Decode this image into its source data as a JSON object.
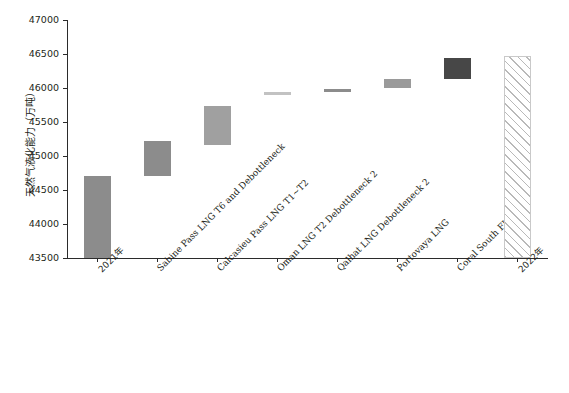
{
  "chart_data": {
    "type": "bar",
    "title": "",
    "xlabel": "",
    "ylabel": "天然气液化能力（万吨）",
    "ylim": [
      43500,
      47000
    ],
    "ytick_labels": [
      "43500",
      "44000",
      "44500",
      "45000",
      "45500",
      "46000",
      "46500",
      "47000"
    ],
    "ytick_values": [
      43500,
      44000,
      44500,
      45000,
      45500,
      46000,
      46500,
      47000
    ],
    "grid": false,
    "legend": "none",
    "waterfall": true,
    "categories": [
      "2021年",
      "Sabine Pass LNG T6 and Debottleneck",
      "Calcasieu Pass LNG T1~T2",
      "Oman LNG T2 Debottleneck 2",
      "Qalhat LNG Debottleneck 2",
      "Portovaya LNG",
      "Coral South FLNG 1",
      "2022年"
    ],
    "bars": [
      {
        "label": "2021年",
        "base": 43500,
        "top": 44700,
        "value": 44700,
        "kind": "total",
        "color": "#8c8c8c"
      },
      {
        "label": "Sabine Pass LNG T6 and Debottleneck",
        "base": 44700,
        "top": 45220,
        "value": 520,
        "kind": "increment",
        "color": "#8c8c8c"
      },
      {
        "label": "Calcasieu Pass LNG T1~T2",
        "base": 45160,
        "top": 45730,
        "value": 570,
        "kind": "increment",
        "color": "#a0a0a0"
      },
      {
        "label": "Oman LNG T2 Debottleneck 2",
        "base": 45890,
        "top": 45940,
        "value": 50,
        "kind": "increment",
        "color": "#c2c2c2"
      },
      {
        "label": "Qalhat LNG Debottleneck 2",
        "base": 45940,
        "top": 45990,
        "value": 50,
        "kind": "increment",
        "color": "#8c8c8c"
      },
      {
        "label": "Portovaya LNG",
        "base": 46000,
        "top": 46130,
        "value": 130,
        "kind": "increment",
        "color": "#9a9a9a"
      },
      {
        "label": "Coral South FLNG 1",
        "base": 46130,
        "top": 46440,
        "value": 310,
        "kind": "increment",
        "color": "#474747"
      },
      {
        "label": "2022年",
        "base": 43500,
        "top": 46470,
        "value": 46470,
        "kind": "total-hatched",
        "color": "#ffffff"
      }
    ]
  }
}
